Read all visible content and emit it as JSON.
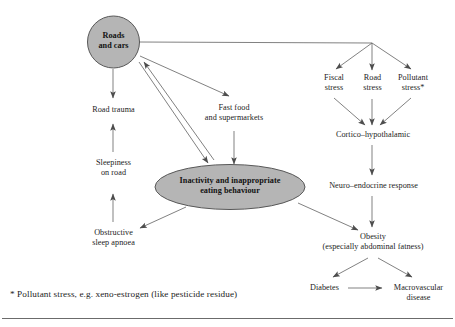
{
  "diagram": {
    "title_shapes": {
      "roads_and_cars": "Roads\nand cars",
      "inactivity": "Inactivity and inappropriate\neating behaviour"
    },
    "nodes": [
      {
        "id": "road-trauma",
        "label": "Road trauma"
      },
      {
        "id": "sleepiness",
        "label": "Sleepiness\non road"
      },
      {
        "id": "obstructive-apnoea",
        "label": "Obstructive\nsleep apnoea"
      },
      {
        "id": "fast-food",
        "label": "Fast food\nand supermarkets"
      },
      {
        "id": "fiscal-stress",
        "label": "Fiscal\nstress"
      },
      {
        "id": "road-stress",
        "label": "Road\nstress"
      },
      {
        "id": "pollutant-stress",
        "label": "Pollutant\nstress*"
      },
      {
        "id": "cortico",
        "label": "Cortico–hypothalamic"
      },
      {
        "id": "neuro-endocrine",
        "label": "Neuro–endocrine response"
      },
      {
        "id": "obesity",
        "label": "Obesity\n(especially abdominal fatness)"
      },
      {
        "id": "diabetes",
        "label": "Diabetes"
      },
      {
        "id": "macrovascular",
        "label": "Macrovascular\ndisease"
      }
    ],
    "footnote": "* Pollutant stress, e.g. xeno-estrogen (like pesticide residue)",
    "colors": {
      "shape_fill": "#b5b5b5",
      "shape_stroke": "#4a4a4a",
      "arrow": "#5a5a5a",
      "text": "#1c1c1c",
      "rule": "#6b6b6b",
      "background": "#ffffff"
    }
  }
}
